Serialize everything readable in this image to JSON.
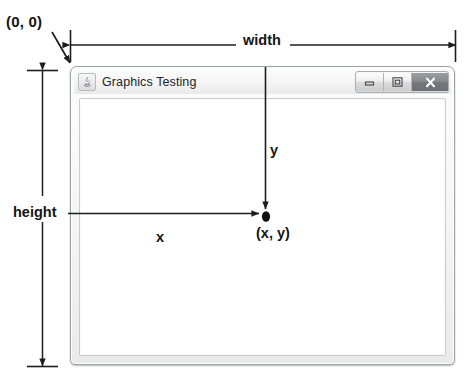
{
  "diagram": {
    "origin_label": "(0, 0)",
    "width_label": "width",
    "height_label": "height",
    "y_label": "y",
    "x_label": "x",
    "point_label": "(x, y)",
    "line_color": "#1d1d1d"
  },
  "window": {
    "title": "Graphics Testing",
    "icon": "java-coffee-cup-icon",
    "controls": {
      "minimize_name": "minimize-button",
      "maximize_name": "maximize-button",
      "close_name": "close-button"
    },
    "accent_close_bg": "#7b7f83",
    "frame_border": "#9aa0a6",
    "content_bg": "#ffffff"
  }
}
